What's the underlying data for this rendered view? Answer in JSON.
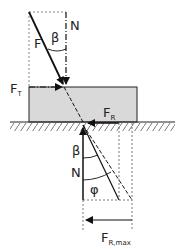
{
  "labels": {
    "force": "F",
    "normal_top": "N",
    "beta_top": "β",
    "tangential_main": "F",
    "tangential_sub": "T",
    "friction_main": "F",
    "friction_sub": "R",
    "beta_bottom": "β",
    "normal_bottom": "N",
    "phi": "φ",
    "friction_max_main": "F",
    "friction_max_sub": "R,max"
  },
  "colors": {
    "line": "#111111",
    "block_fill": "#d9d9d9",
    "block_stroke": "#222222",
    "hatch": "#777777"
  }
}
